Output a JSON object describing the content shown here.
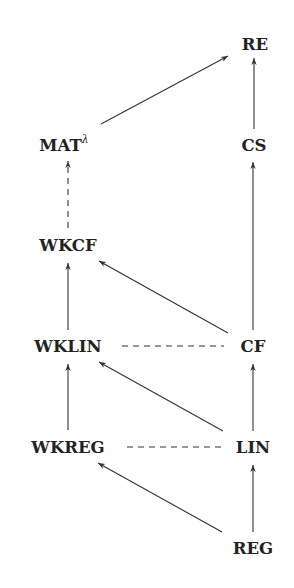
{
  "diagram": {
    "type": "hasse-diagram",
    "nodes": [
      {
        "id": "RE",
        "label": "RE",
        "sup": "",
        "x": 255,
        "y": 50
      },
      {
        "id": "CS",
        "label": "CS",
        "sup": "",
        "x": 254,
        "y": 151
      },
      {
        "id": "MAT",
        "label": "MAT",
        "sup": "λ",
        "x": 64,
        "y": 151
      },
      {
        "id": "WKCF",
        "label": "WKCF",
        "sup": "",
        "x": 68,
        "y": 251
      },
      {
        "id": "WKLIN",
        "label": "WKLIN",
        "sup": "",
        "x": 68,
        "y": 352
      },
      {
        "id": "CF",
        "label": "CF",
        "sup": "",
        "x": 253,
        "y": 352
      },
      {
        "id": "WKREG",
        "label": "WKREG",
        "sup": "",
        "x": 68,
        "y": 453
      },
      {
        "id": "LIN",
        "label": "LIN",
        "sup": "",
        "x": 253,
        "y": 453
      },
      {
        "id": "REG",
        "label": "REG",
        "sup": "",
        "x": 253,
        "y": 554
      }
    ],
    "edges": [
      {
        "from": "MAT",
        "to": "RE",
        "style": "solid-arrow",
        "x1": 101,
        "y1": 124,
        "x2": 228,
        "y2": 56
      },
      {
        "from": "CS",
        "to": "RE",
        "style": "solid-arrow",
        "x1": 254,
        "y1": 129,
        "x2": 254,
        "y2": 58
      },
      {
        "from": "WKCF",
        "to": "MAT",
        "style": "dashed-arrow",
        "x1": 68,
        "y1": 228,
        "x2": 68,
        "y2": 161
      },
      {
        "from": "CF",
        "to": "CS",
        "style": "solid-arrow",
        "x1": 253,
        "y1": 330,
        "x2": 253,
        "y2": 162
      },
      {
        "from": "WKLIN",
        "to": "WKCF",
        "style": "solid-arrow",
        "x1": 68,
        "y1": 330,
        "x2": 68,
        "y2": 263
      },
      {
        "from": "CF",
        "to": "WKCF",
        "style": "solid-arrow",
        "x1": 228,
        "y1": 333,
        "x2": 99,
        "y2": 261
      },
      {
        "from": "WKLIN",
        "to": "CF",
        "style": "dashed-line",
        "x1": 122,
        "y1": 346,
        "x2": 224,
        "y2": 346
      },
      {
        "from": "LIN",
        "to": "WKLIN",
        "style": "solid-arrow",
        "x1": 223,
        "y1": 431,
        "x2": 99,
        "y2": 362
      },
      {
        "from": "LIN",
        "to": "CF",
        "style": "solid-arrow",
        "x1": 253,
        "y1": 431,
        "x2": 253,
        "y2": 364
      },
      {
        "from": "WKREG",
        "to": "WKLIN",
        "style": "solid-arrow",
        "x1": 68,
        "y1": 430,
        "x2": 68,
        "y2": 364
      },
      {
        "from": "WKREG",
        "to": "LIN",
        "style": "dashed-line",
        "x1": 127,
        "y1": 447,
        "x2": 222,
        "y2": 447
      },
      {
        "from": "REG",
        "to": "WKREG",
        "style": "solid-arrow",
        "x1": 222,
        "y1": 532,
        "x2": 98,
        "y2": 463
      },
      {
        "from": "REG",
        "to": "LIN",
        "style": "solid-arrow",
        "x1": 253,
        "y1": 532,
        "x2": 253,
        "y2": 465
      }
    ]
  },
  "colors": {
    "background": "#ffffff",
    "ink": "#222222",
    "edge": "#333333"
  }
}
